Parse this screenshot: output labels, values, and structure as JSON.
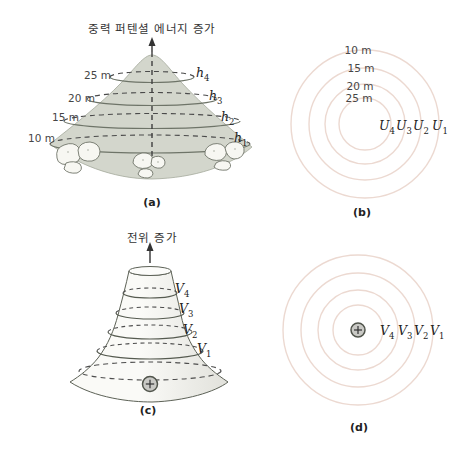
{
  "figure": {
    "description_colors": {
      "hill_fill": "#d3d6cc",
      "contour_line": "#6e7468",
      "dashed_line": "#4a4a4a",
      "equipotential_ring": "#ecd9d1",
      "funnel_outline": "#5c6156",
      "charge_fill": "#c9c9c5"
    },
    "icons": {
      "positive_charge": "+"
    }
  },
  "panel_a": {
    "caption": "(a)",
    "axis_label": "중력 퍼텐셜 에너지 증가",
    "contour_heights": [
      "25 m",
      "20 m",
      "15 m",
      "10 m"
    ],
    "height_labels": [
      {
        "base": "h",
        "sub": "4"
      },
      {
        "base": "h",
        "sub": "3"
      },
      {
        "base": "h",
        "sub": "2"
      },
      {
        "base": "h",
        "sub": "1"
      }
    ]
  },
  "panel_b": {
    "caption": "(b)",
    "ring_heights": [
      "10 m",
      "15 m",
      "20 m",
      "25 m"
    ],
    "energy_labels": [
      {
        "base": "U",
        "sub": "4"
      },
      {
        "base": "U",
        "sub": "3"
      },
      {
        "base": "U",
        "sub": "2"
      },
      {
        "base": "U",
        "sub": "1"
      }
    ]
  },
  "panel_c": {
    "caption": "(c)",
    "axis_label": "전위 증가",
    "potential_labels": [
      {
        "base": "V",
        "sub": "4"
      },
      {
        "base": "V",
        "sub": "3"
      },
      {
        "base": "V",
        "sub": "2"
      },
      {
        "base": "V",
        "sub": "1"
      }
    ]
  },
  "panel_d": {
    "caption": "(d)",
    "potential_labels": [
      {
        "base": "V",
        "sub": "4"
      },
      {
        "base": "V",
        "sub": "3"
      },
      {
        "base": "V",
        "sub": "2"
      },
      {
        "base": "V",
        "sub": "1"
      }
    ]
  }
}
